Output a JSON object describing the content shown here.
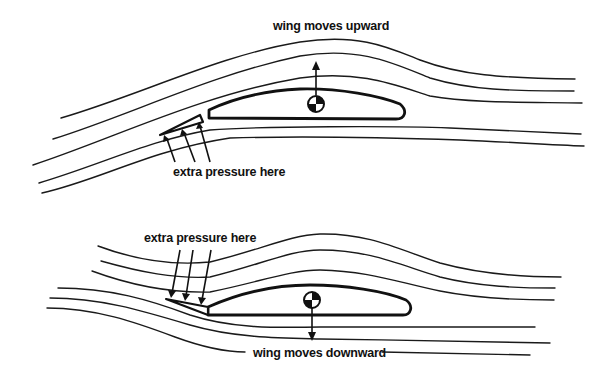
{
  "diagram": {
    "top": {
      "title_label": "wing moves upward",
      "pressure_label": "extra pressure here",
      "cg_arrow_direction": "up",
      "slat_position": "below leading edge, deflected downward (pressure from below)"
    },
    "bottom": {
      "title_label": "wing moves downward",
      "pressure_label": "extra pressure here",
      "cg_arrow_direction": "down",
      "slat_position": "at leading edge, pressure from above"
    },
    "elements": {
      "streamlines_per_panel": 5,
      "pressure_arrows_per_panel": 3,
      "cg_marker": "centre-of-gravity-symbol"
    },
    "colors": {
      "ink": "#111111",
      "background": "#ffffff"
    }
  }
}
